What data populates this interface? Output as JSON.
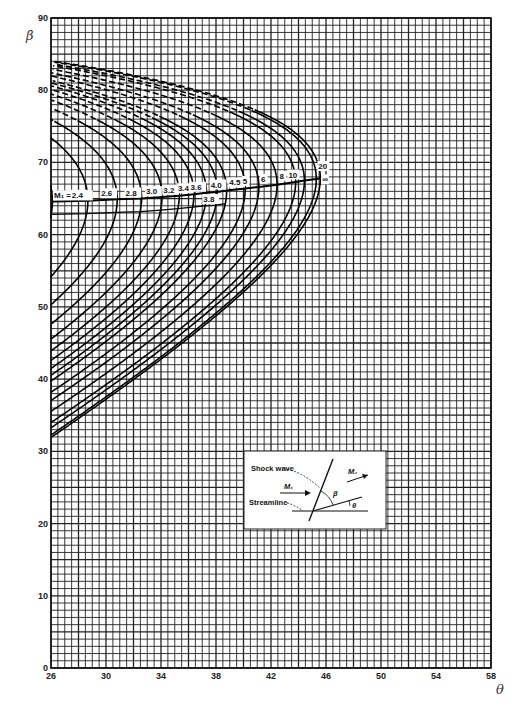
{
  "chart_data": {
    "type": "line",
    "title": "",
    "xlabel": "θ",
    "ylabel": "β",
    "xlim": [
      26,
      58
    ],
    "ylim": [
      0,
      90
    ],
    "x_ticks": [
      26,
      30,
      34,
      38,
      42,
      46,
      50,
      54,
      58
    ],
    "y_ticks": [
      0,
      10,
      20,
      30,
      40,
      50,
      60,
      70,
      80,
      90
    ],
    "grid": true,
    "gamma": 1.4,
    "legend_position": "none",
    "series_label_prefix": "M₁ =",
    "series": [
      {
        "name": "2.2",
        "mach": 2.2,
        "theta_max": 26.1,
        "beta_at_max": 64.8
      },
      {
        "name": "2.4",
        "mach": 2.4,
        "theta_max": 28.4,
        "beta_at_max": 65.0
      },
      {
        "name": "2.6",
        "mach": 2.6,
        "theta_max": 30.3,
        "beta_at_max": 65.3
      },
      {
        "name": "2.8",
        "mach": 2.8,
        "theta_max": 31.9,
        "beta_at_max": 65.6
      },
      {
        "name": "3.0",
        "mach": 3.0,
        "theta_max": 34.1,
        "beta_at_max": 65.8
      },
      {
        "name": "3.2",
        "mach": 3.2,
        "theta_max": 35.3,
        "beta_at_max": 66.0
      },
      {
        "name": "3.4",
        "mach": 3.4,
        "theta_max": 36.3,
        "beta_at_max": 66.2
      },
      {
        "name": "3.6",
        "mach": 3.6,
        "theta_max": 37.2,
        "beta_at_max": 66.4
      },
      {
        "name": "3.8",
        "mach": 3.8,
        "theta_max": 38.0,
        "beta_at_max": 66.5
      },
      {
        "name": "4.0",
        "mach": 4.0,
        "theta_max": 38.8,
        "beta_at_max": 66.6
      },
      {
        "name": "4.5",
        "mach": 4.5,
        "theta_max": 40.3,
        "beta_at_max": 66.9
      },
      {
        "name": "5",
        "mach": 5,
        "theta_max": 41.1,
        "beta_at_max": 67.1
      },
      {
        "name": "6",
        "mach": 6,
        "theta_max": 42.4,
        "beta_at_max": 67.3
      },
      {
        "name": "8",
        "mach": 8,
        "theta_max": 43.8,
        "beta_at_max": 67.5
      },
      {
        "name": "10",
        "mach": 10,
        "theta_max": 44.4,
        "beta_at_max": 67.6
      },
      {
        "name": "20",
        "mach": 20,
        "theta_max": 45.1,
        "beta_at_max": 67.7
      },
      {
        "name": "∞",
        "mach": 1000,
        "theta_max": 45.6,
        "beta_at_max": 67.8
      }
    ],
    "annotations": {
      "curve_labels": [
        "M₁ = 2.2",
        "2.4",
        "2.6",
        "2.8",
        "3.0",
        "3.2",
        "3.4",
        "3.6",
        "3.8",
        "4.0",
        "4.5",
        "5",
        "6",
        "8",
        "10",
        "20",
        "∞"
      ],
      "inset": {
        "shock_wave": "Shock wave",
        "streamline": "Streamline",
        "m1": "M₁",
        "m2": "M₂",
        "beta": "β",
        "theta": "θ"
      }
    }
  },
  "axis": {
    "x_label": "θ",
    "y_label": "β"
  },
  "inset": {
    "shock_wave": "Shock wave",
    "streamline": "Streamline",
    "m1": "M₁",
    "m2": "M₂",
    "beta": "β",
    "theta": "θ"
  }
}
